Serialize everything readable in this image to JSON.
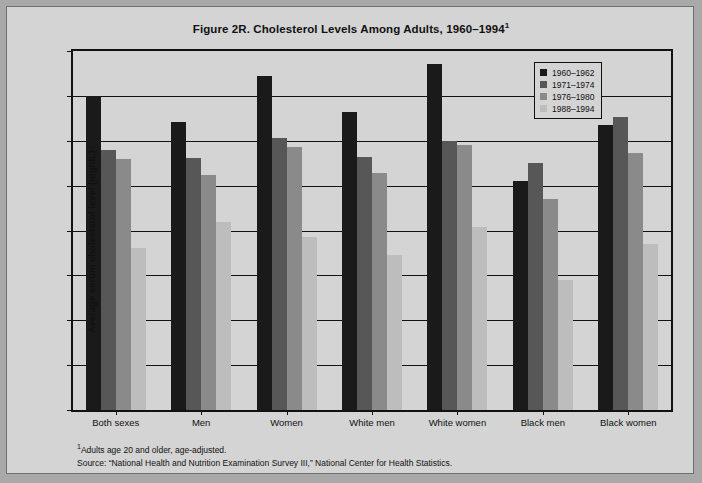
{
  "chart_data": {
    "type": "bar",
    "title": "Figure 2R. Cholesterol Levels Among Adults, 1960–1994",
    "title_superscript": "1",
    "xlabel": "",
    "ylabel": "Average serum cholesterol level (mg/dL)",
    "ylim": [
      185,
      225
    ],
    "yticks": [
      185,
      190,
      195,
      200,
      205,
      210,
      215,
      220,
      225
    ],
    "grid": true,
    "legend_position": "top-right-inside",
    "categories": [
      "Both sexes",
      "Men",
      "Women",
      "White men",
      "White women",
      "Black men",
      "Black women"
    ],
    "series": [
      {
        "name": "1960–1962",
        "color": "#1a1a1a",
        "values": [
          220.0,
          217.1,
          222.2,
          218.2,
          223.5,
          210.5,
          216.8
        ]
      },
      {
        "name": "1971–1974",
        "color": "#575757",
        "values": [
          214.0,
          213.1,
          215.3,
          213.2,
          215.0,
          212.5,
          217.6
        ]
      },
      {
        "name": "1976–1980",
        "color": "#8a8a8a",
        "values": [
          213.0,
          211.2,
          214.3,
          211.4,
          214.5,
          208.5,
          213.6
        ]
      },
      {
        "name": "1988–1994",
        "color": "#bdbdbd",
        "values": [
          203.0,
          206.0,
          204.3,
          202.3,
          205.4,
          199.5,
          203.5
        ]
      }
    ]
  },
  "footnotes": {
    "marker": "1",
    "note": "Adults age 20 and older, age-adjusted.",
    "source": "Source: “National Health and Nutrition Examination Survey III,” National Center for Health Statistics."
  },
  "colors": {
    "page_background": "#d4d4d4",
    "frame_border": "#111111",
    "outer_border": "#6e6e6e",
    "text": "#111111"
  }
}
